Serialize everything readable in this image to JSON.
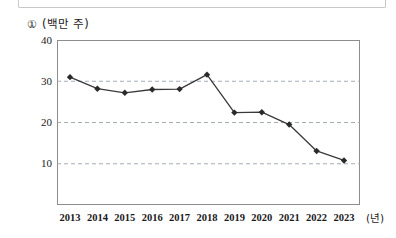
{
  "figure": {
    "item_marker": "①",
    "unit_label": "(백만 주)",
    "x_axis_unit": "(년)"
  },
  "chart_data": {
    "type": "line",
    "title": "",
    "subtitle": "",
    "xlabel": "(년)",
    "ylabel": "(백만 주)",
    "categories": [
      "2013",
      "2014",
      "2015",
      "2016",
      "2017",
      "2018",
      "2019",
      "2020",
      "2021",
      "2022",
      "2023"
    ],
    "values": [
      31.0,
      28.2,
      27.2,
      28.0,
      28.1,
      31.6,
      22.4,
      22.5,
      19.5,
      13.1,
      10.8
    ],
    "ylim": [
      0,
      40
    ],
    "yticks": [
      10,
      20,
      30,
      40
    ],
    "ytick_labels": [
      "10",
      "20",
      "30",
      "40"
    ],
    "gridlines": [
      10,
      20,
      30
    ],
    "grid": true,
    "grid_style": "dashed",
    "legend": "none",
    "marker": "diamond",
    "line_color": "#3a3a3a",
    "marker_color": "#2a2a2a",
    "grid_color": "#9aa4b0"
  }
}
